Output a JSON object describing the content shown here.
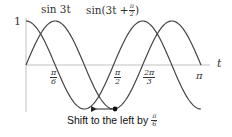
{
  "chart_data": {
    "type": "line",
    "title": "",
    "xlabel": "t",
    "ylabel": "",
    "xlim": [
      0,
      3.14159
    ],
    "ylim": [
      -1,
      1
    ],
    "grid": false,
    "y_ticks": [
      {
        "value": 1,
        "label": "1"
      }
    ],
    "x_ticks": [
      {
        "value": 0.5236,
        "label_num": "π",
        "label_den": "6"
      },
      {
        "value": 1.5708,
        "label_num": "π",
        "label_den": "2"
      },
      {
        "value": 2.0944,
        "label_num": "2π",
        "label_den": "3"
      },
      {
        "value": 3.14159,
        "label": "π"
      }
    ],
    "series": [
      {
        "name": "sin 3t",
        "expression": "sin(3t)",
        "x_range": [
          0,
          3.14159
        ]
      },
      {
        "name": "sin(3t + π/2)",
        "expression": "sin(3t + pi/2)",
        "x_range": [
          0,
          3.14159
        ]
      }
    ],
    "annotations": [
      {
        "type": "point",
        "x": 1.5708,
        "y": -1,
        "label": "minimum of sin 3t"
      },
      {
        "type": "arrow",
        "from": [
          1.5708,
          -1
        ],
        "to": [
          1.0472,
          -1
        ],
        "direction": "left"
      },
      {
        "type": "text",
        "text": "Shift to the left by",
        "frac_num": "π",
        "frac_den": "6"
      }
    ]
  },
  "labels": {
    "series1": "sin 3t",
    "series2_prefix": "sin(3t + ",
    "series2_frac_num": "π",
    "series2_frac_den": "2",
    "series2_suffix": ")",
    "y_one": "1",
    "x_axis": "t",
    "tick_pi6_num": "π",
    "tick_pi6_den": "6",
    "tick_pi2_num": "π",
    "tick_pi2_den": "2",
    "tick_2pi3_num": "2π",
    "tick_2pi3_den": "3",
    "tick_pi": "π",
    "caption_text": "Shift to the left by",
    "caption_frac_num": "π",
    "caption_frac_den": "6"
  },
  "colors": {
    "curve": "#444444",
    "axis": "#bbbbbb",
    "text": "#333333"
  }
}
